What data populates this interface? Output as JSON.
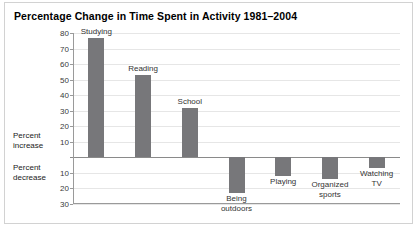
{
  "chart_data": {
    "type": "bar",
    "title": "Percentage Change in Time Spent in Activity 1981–2004",
    "xlabel": "",
    "ylabel": "",
    "categories": [
      "Studying",
      "Reading",
      "School",
      "Being\noutdoors",
      "Playing",
      "Organized\nsports",
      "Watching\nTV"
    ],
    "values": [
      77,
      53,
      32,
      -23,
      -12,
      -14,
      -7
    ],
    "ylim": [
      -30,
      80
    ],
    "yticks_positive": [
      80,
      70,
      60,
      50,
      40,
      30,
      20,
      10
    ],
    "yticks_negative": [
      10,
      20,
      30
    ],
    "axis_label_increase": "Percent\nincrease",
    "axis_label_decrease": "Percent\ndecrease",
    "grid": true,
    "legend": "none",
    "bar_color": "#77777a",
    "grid_color": "#e6e6e6",
    "axis_color": "#9a9a9a"
  }
}
